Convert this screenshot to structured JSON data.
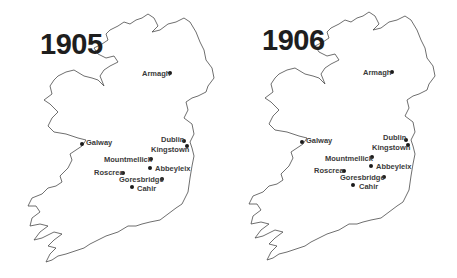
{
  "maps": [
    {
      "year": "1905",
      "places": [
        {
          "name": "Armagh",
          "label_x": 142,
          "label_y": 70,
          "dot_x": 170,
          "dot_y": 73,
          "label_side": "left"
        },
        {
          "name": "Galway",
          "label_x": 86,
          "label_y": 139,
          "dot_x": 82,
          "dot_y": 144,
          "label_side": "right"
        },
        {
          "name": "Dublin",
          "label_x": 161,
          "label_y": 136,
          "dot_x": 184,
          "dot_y": 141,
          "label_side": "left"
        },
        {
          "name": "Kingstown",
          "label_x": 151,
          "label_y": 146,
          "dot_x": 187,
          "dot_y": 146,
          "label_side": "left"
        },
        {
          "name": "Mountmellick",
          "label_x": 104,
          "label_y": 156,
          "dot_x": 151,
          "dot_y": 159,
          "label_side": "left"
        },
        {
          "name": "Abbeyleix",
          "label_x": 155,
          "label_y": 165,
          "dot_x": 150,
          "dot_y": 168,
          "label_side": "right"
        },
        {
          "name": "Roscrea",
          "label_x": 94,
          "label_y": 169,
          "dot_x": 123,
          "dot_y": 173,
          "label_side": "left"
        },
        {
          "name": "Goresbridge",
          "label_x": 119,
          "label_y": 176,
          "dot_x": 162,
          "dot_y": 179,
          "label_side": "left"
        },
        {
          "name": "Cahir",
          "label_x": 137,
          "label_y": 185,
          "dot_x": 132,
          "dot_y": 187,
          "label_side": "right"
        }
      ]
    },
    {
      "year": "1906",
      "places": [
        {
          "name": "Armagh",
          "label_x": 135,
          "label_y": 69,
          "dot_x": 164,
          "dot_y": 72,
          "label_side": "left"
        },
        {
          "name": "Galway",
          "label_x": 78,
          "label_y": 137,
          "dot_x": 74,
          "dot_y": 142,
          "label_side": "right"
        },
        {
          "name": "Dublin",
          "label_x": 155,
          "label_y": 134,
          "dot_x": 178,
          "dot_y": 140,
          "label_side": "left"
        },
        {
          "name": "Kingstown",
          "label_x": 144,
          "label_y": 144,
          "dot_x": 180,
          "dot_y": 145,
          "label_side": "left"
        },
        {
          "name": "Mountmellick",
          "label_x": 97,
          "label_y": 155,
          "dot_x": 144,
          "dot_y": 157,
          "label_side": "left"
        },
        {
          "name": "Abbeyleix",
          "label_x": 148,
          "label_y": 163,
          "dot_x": 143,
          "dot_y": 166,
          "label_side": "right"
        },
        {
          "name": "Roscrea",
          "label_x": 86,
          "label_y": 167,
          "dot_x": 116,
          "dot_y": 171,
          "label_side": "left"
        },
        {
          "name": "Goresbridge",
          "label_x": 112,
          "label_y": 174,
          "dot_x": 156,
          "dot_y": 177,
          "label_side": "left"
        },
        {
          "name": "Cahir",
          "label_x": 131,
          "label_y": 183,
          "dot_x": 125,
          "dot_y": 185,
          "label_side": "right"
        }
      ]
    }
  ],
  "colors": {
    "text": "#1e1e1e",
    "coastline": "#4a4a4a",
    "background": "#ffffff"
  }
}
